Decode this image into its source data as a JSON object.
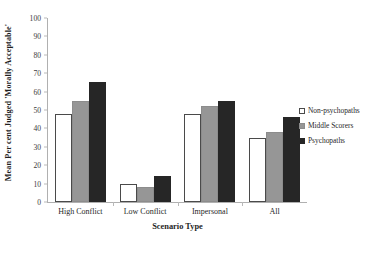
{
  "chart_data": {
    "type": "bar",
    "title": "",
    "subtitle": "",
    "xlabel": "Scenario Type",
    "ylabel": "Mean Per cent Judged 'Morally Acceptable'",
    "categories": [
      "High Conflict",
      "Low Conflict",
      "Impersonal",
      "All"
    ],
    "series": [
      {
        "name": "Non-psychopaths",
        "color": "#ffffff",
        "values": [
          48,
          10,
          48,
          35
        ]
      },
      {
        "name": "Middle Scorers",
        "color": "#969696",
        "values": [
          55,
          8,
          52,
          38
        ]
      },
      {
        "name": "Psychopaths",
        "color": "#262626",
        "values": [
          65,
          14,
          55,
          46
        ]
      }
    ],
    "ylim": [
      0,
      100
    ],
    "yticks": [
      0,
      10,
      20,
      30,
      40,
      50,
      60,
      70,
      80,
      90,
      100
    ],
    "ytick_labels": [
      "0",
      "10",
      "20",
      "30",
      "40",
      "50",
      "60",
      "70",
      "80",
      "90",
      "100"
    ],
    "grid": false,
    "legend_position": "right"
  },
  "legend": {
    "items": [
      {
        "label": "Non-psychopaths"
      },
      {
        "label": "Middle Scorers"
      },
      {
        "label": "Psychopaths"
      }
    ]
  }
}
